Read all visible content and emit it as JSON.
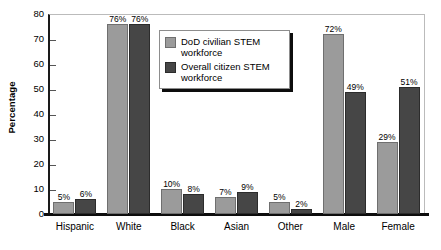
{
  "chart_data": {
    "type": "bar",
    "title": "",
    "xlabel": "",
    "ylabel": "Percentage",
    "ylim": [
      0,
      80
    ],
    "yticks": [
      0,
      10,
      20,
      30,
      40,
      50,
      60,
      70,
      80
    ],
    "ytick_labels": [
      "0",
      "10",
      "20",
      "30",
      "40",
      "50",
      "60",
      "70",
      "80"
    ],
    "grid": false,
    "legend_position": "upper center",
    "value_label_suffix": "%",
    "categories": [
      "Hispanic",
      "White",
      "Black",
      "Asian",
      "Other",
      "Male",
      "Female"
    ],
    "series": [
      {
        "name": "DoD civilian STEM workforce",
        "color": "#9b9b9b",
        "values": [
          5,
          76,
          10,
          7,
          5,
          72,
          29
        ],
        "labels": [
          "5%",
          "76%",
          "10%",
          "7%",
          "5%",
          "72%",
          "29%"
        ]
      },
      {
        "name": "Overall citizen STEM workforce",
        "color": "#464646",
        "values": [
          6,
          76,
          8,
          9,
          2,
          49,
          51
        ],
        "labels": [
          "6%",
          "76%",
          "8%",
          "9%",
          "2%",
          "49%",
          "51%"
        ]
      }
    ]
  }
}
